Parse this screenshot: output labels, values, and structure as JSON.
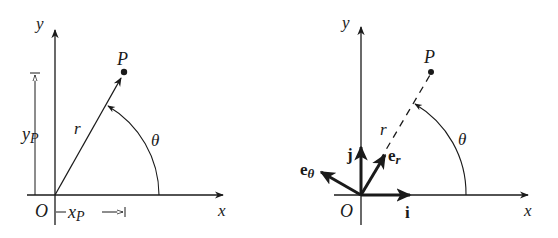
{
  "figure": {
    "left_panel": {
      "description": "Cartesian coordinates of point P",
      "axis_x_label": "x",
      "axis_y_label": "y",
      "origin_label": "O",
      "point_label": "P",
      "radius_label": "r",
      "angle_label": "θ",
      "xp_label": "x",
      "xp_sub": "P",
      "yp_label": "y",
      "yp_sub": "P"
    },
    "right_panel": {
      "description": "Polar unit vectors at origin",
      "axis_x_label": "x",
      "axis_y_label": "y",
      "origin_label": "O",
      "point_label": "P",
      "radius_label": "r",
      "angle_label": "θ",
      "unit_i": "i",
      "unit_j": "j",
      "unit_er": "e",
      "unit_er_sub": "r",
      "unit_etheta": "e",
      "unit_etheta_sub": "θ"
    },
    "colors": {
      "ink": "#1a1a1a",
      "background": "#ffffff"
    }
  }
}
